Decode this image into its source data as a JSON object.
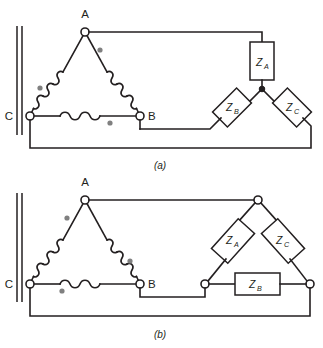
{
  "figure": {
    "caption_a": "(a)",
    "caption_b": "(b)",
    "terminals": {
      "a": "A",
      "b": "B",
      "c": "C"
    },
    "impedances": {
      "za_main": "Z",
      "za_sub": "A",
      "zb_main": "Z",
      "zb_sub": "B",
      "zc_main": "Z",
      "zc_sub": "C"
    }
  },
  "diagram_a": {
    "source_type": "delta-connected-winding",
    "load_type": "wye-connected-load",
    "terminal_labels": [
      "A",
      "B",
      "C"
    ],
    "load_labels": [
      "ZA",
      "ZB",
      "ZC"
    ],
    "polarity_dot_count": 3,
    "caption": "(a)"
  },
  "diagram_b": {
    "source_type": "delta-connected-winding",
    "load_type": "delta-connected-load",
    "terminal_labels": [
      "A",
      "B",
      "C"
    ],
    "load_labels": [
      "ZA",
      "ZB",
      "ZC"
    ],
    "polarity_dot_count": 3,
    "caption": "(b)"
  },
  "colors": {
    "line": "#231f20",
    "dot": "#808080",
    "background": "#ffffff"
  }
}
